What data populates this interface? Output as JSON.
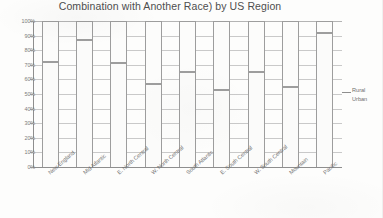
{
  "chart_data": {
    "type": "bar",
    "subtype": "stacked-100-percent",
    "title": "Combination with Another Race) by US Region",
    "xlabel": "",
    "ylabel": "",
    "ylim": [
      0,
      100
    ],
    "ytick_labels": [
      "100%",
      "90%",
      "80%",
      "70%",
      "60%",
      "50%",
      "40%",
      "30%",
      "20%",
      "10%",
      "0%"
    ],
    "ytick_values": [
      100,
      90,
      80,
      70,
      60,
      50,
      40,
      30,
      20,
      10,
      0
    ],
    "grid": true,
    "legend_position": "right",
    "categories": [
      "New England",
      "Mid Atlantic",
      "E. North Central",
      "W. North Central",
      "South Atlantic",
      "E. South Central",
      "W. South Central",
      "Mountain",
      "Pacific"
    ],
    "series": [
      {
        "name": "Urban",
        "values": [
          72,
          87,
          71,
          57,
          65,
          53,
          65,
          55,
          92
        ]
      },
      {
        "name": "Rural",
        "values": [
          28,
          13,
          29,
          43,
          35,
          47,
          35,
          45,
          8
        ]
      }
    ],
    "legend_entries": [
      "Rural",
      "Urban"
    ],
    "colors": {
      "urban": "#fbfbfa",
      "rural": "#fcfcfb",
      "outline": "#9d9d9d",
      "grid": "#c9c9c9",
      "axis": "#8e8e8e",
      "text": "#6e6e6e"
    }
  }
}
